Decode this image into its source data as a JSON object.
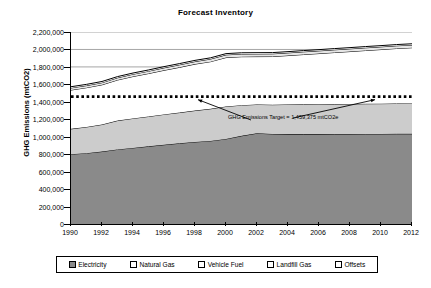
{
  "chart_data": {
    "type": "area",
    "title": "Forecast Inventory",
    "xlabel": "",
    "ylabel": "GHG Emissions (mtCO2)",
    "stacked": true,
    "grid": true,
    "legend_position": "bottom",
    "xlim": [
      1990,
      2012
    ],
    "ylim": [
      0,
      2200000
    ],
    "ytick_step": 200000,
    "x": [
      1990,
      1991,
      1992,
      1993,
      1994,
      1995,
      1996,
      1997,
      1998,
      1999,
      2000,
      2001,
      2002,
      2003,
      2004,
      2005,
      2006,
      2007,
      2008,
      2009,
      2010,
      2011,
      2012
    ],
    "xtick_labels": [
      "1990",
      "1992",
      "1994",
      "1996",
      "1998",
      "2000",
      "2002",
      "2004",
      "2006",
      "2008",
      "2010",
      "2012"
    ],
    "ytick_labels": [
      "0",
      "200,000",
      "400,000",
      "600,000",
      "800,000",
      "1,000,000",
      "1,200,000",
      "1,400,000",
      "1,600,000",
      "1,800,000",
      "2,000,000",
      "2,200,000"
    ],
    "series": [
      {
        "name": "Electricity",
        "color": "#8a8a8a",
        "values": [
          800000,
          812000,
          830000,
          855000,
          872000,
          890000,
          908000,
          925000,
          940000,
          952000,
          975000,
          1010000,
          1040000,
          1032000,
          1030000,
          1030000,
          1030000,
          1031000,
          1031000,
          1032000,
          1032000,
          1033000,
          1033000
        ]
      },
      {
        "name": "Natural Gas",
        "color": "#cccccc",
        "values": [
          290000,
          300000,
          310000,
          330000,
          338000,
          342000,
          348000,
          352000,
          360000,
          368000,
          372000,
          352000,
          330000,
          335000,
          340000,
          342000,
          343000,
          344000,
          345000,
          346000,
          347000,
          348000,
          349000
        ]
      },
      {
        "name": "Vehicle Fuel",
        "color": "#ffffff",
        "values": [
          445000,
          450000,
          455000,
          465000,
          480000,
          492000,
          505000,
          518000,
          532000,
          540000,
          560000,
          555000,
          548000,
          552000,
          560000,
          570000,
          580000,
          590000,
          600000,
          610000,
          620000,
          630000,
          638000
        ]
      },
      {
        "name": "Landfill Gas",
        "color": "#e6e6e6",
        "values": [
          24000,
          24000,
          24000,
          25000,
          26000,
          27000,
          28000,
          29000,
          29000,
          30000,
          31000,
          31000,
          31000,
          31000,
          31000,
          31000,
          31000,
          31000,
          31000,
          31000,
          31000,
          31000,
          31000
        ]
      },
      {
        "name": "Offsets",
        "color": "#ffffff",
        "values": [
          14000,
          14000,
          14000,
          14000,
          14000,
          14000,
          14000,
          14000,
          14000,
          14000,
          14000,
          14000,
          14000,
          14000,
          14000,
          14000,
          14000,
          14000,
          14000,
          14000,
          14000,
          14000,
          14000
        ]
      }
    ],
    "target_line": {
      "value": 1459375,
      "style": "dotted",
      "color": "#000000",
      "label": "GHG Emissions Target = 1,459,375 mtCO2e"
    },
    "annotations": [
      {
        "text": "GHG Emissions Target = 1,459,375 mtCO2e"
      }
    ]
  },
  "legend": {
    "items": [
      {
        "label": "Electricity",
        "color": "#8a8a8a"
      },
      {
        "label": "Natural Gas",
        "color": "#ffffff"
      },
      {
        "label": "Vehicle Fuel",
        "color": "#ffffff"
      },
      {
        "label": "Landfill Gas",
        "color": "#ffffff"
      },
      {
        "label": "Offsets",
        "color": "#ffffff"
      }
    ]
  }
}
